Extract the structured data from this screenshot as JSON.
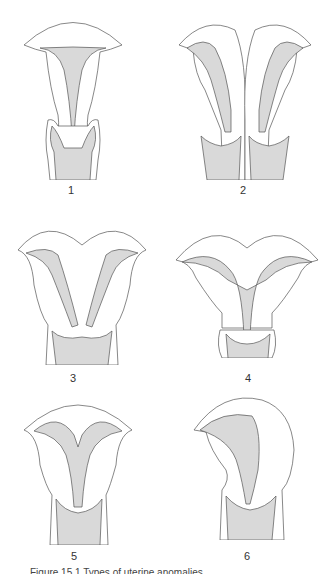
{
  "figure": {
    "panels": [
      {
        "id": 1,
        "label": "1"
      },
      {
        "id": 2,
        "label": "2"
      },
      {
        "id": 3,
        "label": "3"
      },
      {
        "id": 4,
        "label": "4"
      },
      {
        "id": 5,
        "label": "5"
      },
      {
        "id": 6,
        "label": "6"
      }
    ],
    "caption": "Figure 15.1  Types of uterine anomalies",
    "colors": {
      "outline": "#555555",
      "cavity_fill": "#d9d9d9",
      "background": "#ffffff"
    }
  }
}
